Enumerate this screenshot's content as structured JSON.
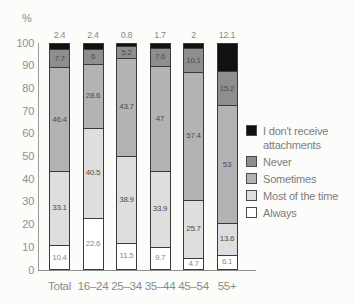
{
  "chart_data": {
    "type": "bar",
    "stacked": true,
    "title": "",
    "axis_label": "%",
    "xlabel": "",
    "ylabel": "%",
    "ylim": [
      0,
      100
    ],
    "yticks": [
      0,
      10,
      20,
      30,
      40,
      50,
      60,
      70,
      80,
      90,
      100
    ],
    "grid": false,
    "legend_position": "right",
    "categories": [
      "Total",
      "16–24",
      "25–34",
      "35–44",
      "45–54",
      "55+"
    ],
    "series": [
      {
        "name": "Always",
        "color": "#ffffff",
        "values": [
          10.4,
          22.6,
          11.5,
          9.7,
          4.7,
          6.1
        ]
      },
      {
        "name": "Most of the time",
        "color": "#dedede",
        "values": [
          33.1,
          40.5,
          38.9,
          33.9,
          25.7,
          13.6
        ]
      },
      {
        "name": "Sometimes",
        "color": "#b3b3b3",
        "values": [
          46.4,
          28.6,
          43.7,
          47,
          57.4,
          53
        ]
      },
      {
        "name": "Never",
        "color": "#8e8e8e",
        "values": [
          7.7,
          6,
          5.2,
          7.6,
          10.1,
          15.2
        ]
      },
      {
        "name": "I don't receive attachments",
        "color": "#111111",
        "values": [
          2.4,
          2.4,
          0.8,
          1.7,
          2,
          12.1
        ],
        "label_position": "above"
      }
    ],
    "legend": [
      {
        "label": "I don't receive attachments",
        "color": "#111111"
      },
      {
        "label": "Never",
        "color": "#8e8e8e"
      },
      {
        "label": "Sometimes",
        "color": "#b3b3b3"
      },
      {
        "label": "Most of the time",
        "color": "#dedede"
      },
      {
        "label": "Always",
        "color": "#ffffff"
      }
    ]
  }
}
